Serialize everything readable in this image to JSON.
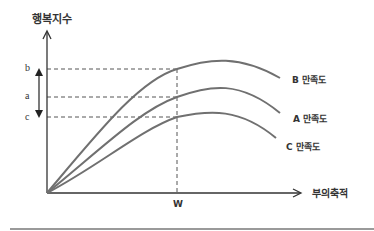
{
  "diagram": {
    "y_axis_title": "행복지수",
    "x_axis_title": "부의축적",
    "y_ticks": {
      "b": "b",
      "a": "a",
      "c": "c"
    },
    "x_ticks": {
      "w": "W"
    },
    "curves": [
      {
        "id": "B",
        "label": "B 만족도"
      },
      {
        "id": "A",
        "label": "A 만족도"
      },
      {
        "id": "C",
        "label": "C 만족도"
      }
    ],
    "colors": {
      "curve": "#707070",
      "axis": "#333333",
      "dashed": "#555555",
      "rule": "#9a9a9a"
    }
  }
}
